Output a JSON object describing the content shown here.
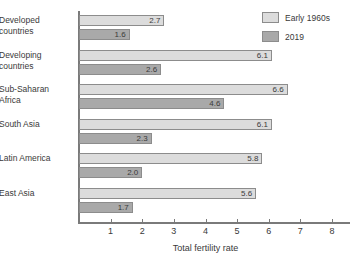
{
  "chart_data": {
    "type": "bar",
    "orientation": "horizontal",
    "title": "",
    "xlabel": "Total fertility rate",
    "ylabel": "",
    "xlim": [
      0,
      8
    ],
    "xticks": [
      0,
      1,
      2,
      3,
      4,
      5,
      6,
      7,
      8
    ],
    "xticklabels": [
      "",
      "1",
      "2",
      "3",
      "4",
      "5",
      "6",
      "7",
      "8"
    ],
    "grid": false,
    "legend_position": "top-right",
    "categories": [
      "Developed countries",
      "Developing countries",
      "Sub-Saharan Africa",
      "South Asia",
      "Latin America",
      "East Asia"
    ],
    "category_lines": [
      [
        "Developed",
        "countries"
      ],
      [
        "Developing",
        "countries"
      ],
      [
        "Sub-Saharan",
        "Africa"
      ],
      [
        "South Asia"
      ],
      [
        "Latin America"
      ],
      [
        "East Asia"
      ]
    ],
    "series": [
      {
        "name": "Early 1960s",
        "color": "#dcdcdc",
        "values": [
          2.7,
          6.1,
          6.6,
          6.1,
          5.8,
          5.6
        ],
        "value_labels": [
          "2.7",
          "6.1",
          "6.6",
          "6.1",
          "5.8",
          "5.6"
        ]
      },
      {
        "name": "2019",
        "color": "#a9a9a9",
        "values": [
          1.6,
          2.6,
          4.6,
          2.3,
          2.0,
          1.7
        ],
        "value_labels": [
          "1.6",
          "2.6",
          "4.6",
          "2.3",
          "2.0",
          "1.7"
        ]
      }
    ]
  },
  "legend": {
    "items": [
      {
        "label": "Early 1960s",
        "swatch": "light"
      },
      {
        "label": "2019",
        "swatch": "dark"
      }
    ]
  },
  "axis": {
    "x_title": "Total fertility rate"
  },
  "colors": {
    "series_early": "#dcdcdc",
    "series_2019": "#a9a9a9",
    "bar_border": "#8c8c8c",
    "axis": "#7a7a7a",
    "text": "#3a3a3a",
    "background": "#ffffff"
  }
}
